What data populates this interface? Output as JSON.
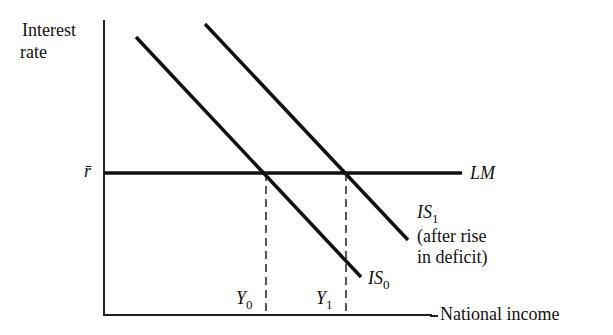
{
  "diagram": {
    "type": "IS-LM",
    "y_axis_label_line1": "Interest",
    "y_axis_label_line2": "rate",
    "x_axis_label": "National income",
    "rbar_label": "r̄",
    "lm_label": "LM",
    "is1_label": "IS",
    "is1_sub": "1",
    "is1_note_line1": "(after rise",
    "is1_note_line2": "in deficit)",
    "is0_label": "IS",
    "is0_sub": "0",
    "y0_label": "Y",
    "y0_sub": "0",
    "y1_label": "Y",
    "y1_sub": "1"
  },
  "colors": {
    "line": "#111111",
    "background": "#ffffff"
  }
}
